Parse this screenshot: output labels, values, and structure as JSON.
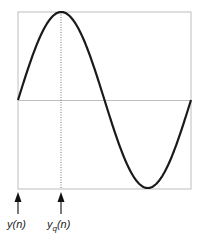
{
  "diagram": {
    "type": "sine-wave-sampling",
    "frame": {
      "x0": 18,
      "y0": 12,
      "x1": 191,
      "y1": 189,
      "midline_y": 100
    },
    "curve": {
      "description": "one full period of sine wave starting at midline, peak near left third, trough near right third",
      "color": "#1a1a1a"
    },
    "markers": [
      {
        "id": "y_n",
        "label": "y(n)",
        "x": 18
      },
      {
        "id": "yq_n",
        "label_main": "y",
        "label_sub": "q",
        "label_tail": "(n)",
        "x": 61
      }
    ],
    "colors": {
      "frame": "#bbbbbb",
      "curve": "#1a1a1a",
      "dotted": "#888888",
      "arrow": "#222222"
    }
  }
}
